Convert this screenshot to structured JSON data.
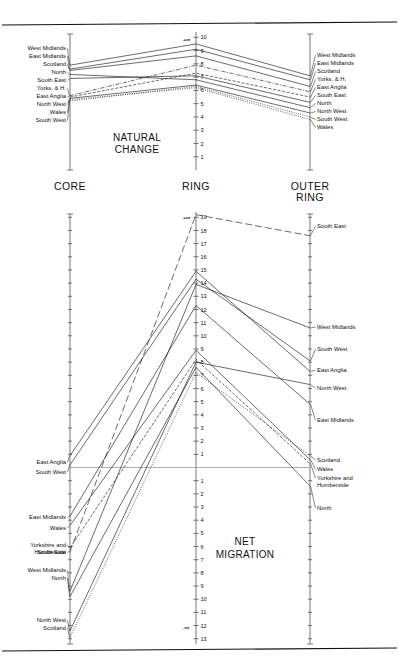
{
  "figure": {
    "zones": [
      "CORE",
      "RING",
      "OUTER RING"
    ],
    "panels": [
      {
        "id": "natural-change",
        "title_line1": "NATURAL",
        "title_line2": "CHANGE",
        "polarity_top": "+ve",
        "y_ticks": [
          10,
          9,
          8,
          7,
          6,
          5,
          4,
          3,
          2,
          1
        ],
        "y_tick_labels_visible": [
          "10",
          "9",
          "8",
          "7",
          "6",
          "5",
          "4",
          "3",
          "2",
          "1"
        ],
        "ylim": [
          0,
          10.4
        ],
        "left_labels": [
          "West Midlands",
          "East Midlands",
          "Scotland",
          "North",
          "South East",
          "Yorks. & H.",
          "East Anglia",
          "North West",
          "Wales",
          "South West"
        ],
        "right_labels": [
          "West Midlands",
          "East Midlands",
          "Scotland",
          "Yorks. & H.",
          "East Anglia",
          "South East",
          "North",
          "North West",
          "South West",
          "Wales"
        ]
      },
      {
        "id": "net-migration",
        "title_line1": "NET",
        "title_line2": "MIGRATION",
        "polarity_top": "+ve",
        "polarity_bottom": "-ve",
        "y_ticks_positive": [
          19,
          18,
          17,
          16,
          15,
          14,
          13,
          12,
          11,
          10,
          9,
          8,
          7,
          6,
          5,
          4,
          3,
          2,
          1
        ],
        "y_ticks_negative": [
          1,
          2,
          3,
          4,
          5,
          6,
          7,
          8,
          9,
          10,
          11,
          12,
          13
        ],
        "ylim": [
          -13.4,
          19.4
        ],
        "left_labels": [
          "East Anglia",
          "South West",
          "East Midlands",
          "Wales",
          "Yorkshire and Humberside",
          "South East",
          "West Midlands",
          "North",
          "North West",
          "Scotland"
        ],
        "right_labels": [
          "South East",
          "West Midlands",
          "South West",
          "East Anglia",
          "North West",
          "East Midlands",
          "Scotland",
          "Wales",
          "Yorkshire and Humberside",
          "North"
        ]
      }
    ]
  },
  "chart_data": [
    {
      "type": "line",
      "title": "NATURAL CHANGE",
      "xlabel": "",
      "ylabel": "",
      "categories": [
        "CORE",
        "RING",
        "OUTER RING"
      ],
      "ylim": [
        0,
        10.4
      ],
      "yticks": [
        1,
        2,
        3,
        4,
        5,
        6,
        7,
        8,
        9,
        10
      ],
      "grid": false,
      "legend": "inline end-labels",
      "annotations": [
        "+ve"
      ],
      "series": [
        {
          "name": "West Midlands",
          "values": [
            7.9,
            9.5,
            7.1
          ],
          "style": "solid"
        },
        {
          "name": "East Midlands",
          "values": [
            7.6,
            9.1,
            6.8
          ],
          "style": "solid"
        },
        {
          "name": "Scotland",
          "values": [
            7.5,
            8.6,
            6.3
          ],
          "style": "solid"
        },
        {
          "name": "Yorks. & H.",
          "values": [
            5.6,
            7.9,
            5.9
          ],
          "style": "dashdot"
        },
        {
          "name": "East Anglia",
          "values": [
            5.5,
            7.3,
            5.5
          ],
          "style": "dash"
        },
        {
          "name": "South East",
          "values": [
            6.9,
            7.1,
            5.1
          ],
          "style": "solid"
        },
        {
          "name": "North",
          "values": [
            7.2,
            6.8,
            4.7
          ],
          "style": "solid"
        },
        {
          "name": "North West",
          "values": [
            5.4,
            6.4,
            4.3
          ],
          "style": "solid"
        },
        {
          "name": "South West",
          "values": [
            5.2,
            6.3,
            4.0
          ],
          "style": "dot"
        },
        {
          "name": "Wales",
          "values": [
            5.3,
            6.2,
            3.8
          ],
          "style": "dot"
        }
      ]
    },
    {
      "type": "line",
      "title": "NET MIGRATION",
      "xlabel": "",
      "ylabel": "",
      "categories": [
        "CORE",
        "RING",
        "OUTER RING"
      ],
      "ylim": [
        -13.4,
        19.4
      ],
      "yticks": [
        19,
        18,
        17,
        16,
        15,
        14,
        13,
        12,
        11,
        10,
        9,
        8,
        7,
        6,
        5,
        4,
        3,
        2,
        1,
        0,
        -1,
        -2,
        -3,
        -4,
        -5,
        -6,
        -7,
        -8,
        -9,
        -10,
        -11,
        -12,
        -13
      ],
      "grid": false,
      "legend": "inline end-labels",
      "annotations": [
        "+ve",
        "-ve"
      ],
      "zero_line": 0,
      "series": [
        {
          "name": "South East",
          "values": [
            -6.4,
            19.2,
            17.6
          ],
          "style": "longdash"
        },
        {
          "name": "East Anglia",
          "values": [
            0.9,
            14.9,
            7.3
          ],
          "style": "solid"
        },
        {
          "name": "South West",
          "values": [
            0.2,
            14.3,
            8.1
          ],
          "style": "solid"
        },
        {
          "name": "West Midlands",
          "values": [
            -9.4,
            13.9,
            10.6
          ],
          "style": "solid"
        },
        {
          "name": "East Midlands",
          "values": [
            -3.7,
            12.3,
            4.8
          ],
          "style": "solid"
        },
        {
          "name": "Wales",
          "values": [
            -4.4,
            8.9,
            0.6
          ],
          "style": "solid"
        },
        {
          "name": "Yorkshire and Humberside",
          "values": [
            -6.1,
            8.2,
            0.3
          ],
          "style": "dash"
        },
        {
          "name": "North West",
          "values": [
            -12.4,
            8.0,
            6.3
          ],
          "style": "solid"
        },
        {
          "name": "North",
          "values": [
            -9.8,
            7.6,
            -1.4
          ],
          "style": "solid"
        },
        {
          "name": "Scotland",
          "values": [
            -12.9,
            7.2,
            0.9
          ],
          "style": "dot"
        }
      ]
    }
  ]
}
